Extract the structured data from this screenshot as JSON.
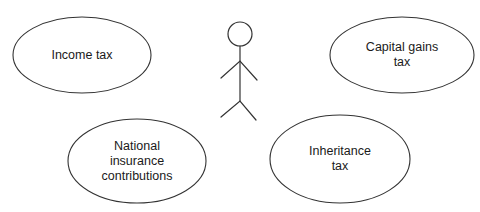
{
  "diagram": {
    "type": "use-case",
    "stroke_color": "#333333",
    "text_color": "#1a1a1a",
    "background": "#ffffff",
    "actor": {
      "name": "",
      "head": {
        "cx": 240,
        "cy": 34,
        "r": 12
      },
      "body": {
        "x": 240,
        "y1": 46,
        "y2": 101
      },
      "arms": {
        "left": [
          221,
          78
        ],
        "center": [
          240,
          61
        ],
        "right": [
          257,
          80
        ]
      },
      "legs": {
        "left": [
          221,
          117
        ],
        "hip": [
          240,
          101
        ],
        "right": [
          256,
          120
        ]
      }
    },
    "use_cases": [
      {
        "id": "income-tax",
        "label": "Income tax",
        "cx": 82,
        "cy": 55,
        "rx": 69,
        "ry": 38
      },
      {
        "id": "capital-gains-tax",
        "label": "Capital gains\ntax",
        "cx": 402,
        "cy": 55,
        "rx": 72,
        "ry": 38
      },
      {
        "id": "national-insurance-contributions",
        "label": "National\ninsurance\ncontributions",
        "cx": 137,
        "cy": 161,
        "rx": 69,
        "ry": 42
      },
      {
        "id": "inheritance-tax",
        "label": "Inheritance\ntax",
        "cx": 340,
        "cy": 159,
        "rx": 70,
        "ry": 44
      }
    ],
    "associations": [
      {
        "from": [
          229,
          108
        ],
        "to": [
          220,
          116
        ]
      },
      {
        "from": [
          250,
          108
        ],
        "to": [
          257,
          120
        ]
      }
    ]
  }
}
